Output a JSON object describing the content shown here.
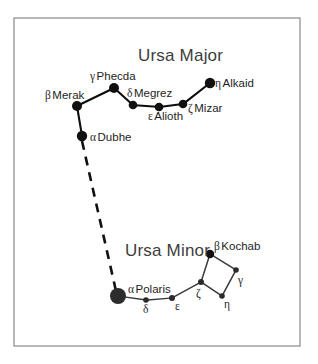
{
  "figure": {
    "title_major": "Ursa Major",
    "title_minor": "Ursa Minor",
    "frame_color": "#8a8a8a",
    "background_color": "#ffffff",
    "star_color": "#101010"
  },
  "chart_data": {
    "type": "scatter",
    "xlabel": "",
    "ylabel": "",
    "grid": false,
    "legend": "none",
    "xlim": [
      0,
      318
    ],
    "ylim": [
      0,
      364
    ],
    "annotations": [
      "Ursa Major",
      "Ursa Minor"
    ],
    "constellations": [
      {
        "name": "Ursa Major",
        "label_x": 138,
        "label_y": 61,
        "stars": [
          {
            "id": "merak",
            "greek": "β",
            "name": "Merak",
            "x": 77,
            "y": 106,
            "r": 5.0,
            "label_x": 45,
            "label_y": 99,
            "label_anchor": "start"
          },
          {
            "id": "phecda",
            "greek": "γ",
            "name": "Phecda",
            "x": 114,
            "y": 88,
            "r": 5.0,
            "label_x": 90,
            "label_y": 80,
            "label_anchor": "start"
          },
          {
            "id": "megrez",
            "greek": "δ",
            "name": "Megrez",
            "x": 133,
            "y": 105,
            "r": 4.3,
            "label_x": 127,
            "label_y": 97,
            "label_anchor": "start"
          },
          {
            "id": "alioth",
            "greek": "ε",
            "name": "Alioth",
            "x": 159,
            "y": 107,
            "r": 4.3,
            "label_x": 148,
            "label_y": 120,
            "label_anchor": "start"
          },
          {
            "id": "mizar",
            "greek": "ζ",
            "name": "Mizar",
            "x": 183,
            "y": 104,
            "r": 4.3,
            "label_x": 188,
            "label_y": 112,
            "label_anchor": "start"
          },
          {
            "id": "alkaid",
            "greek": "η",
            "name": "Alkaid",
            "x": 210,
            "y": 83,
            "r": 5.2,
            "label_x": 215,
            "label_y": 87,
            "label_anchor": "start"
          },
          {
            "id": "dubhe",
            "greek": "α",
            "name": "Dubhe",
            "x": 82,
            "y": 136,
            "r": 5.2,
            "label_x": 90,
            "label_y": 141,
            "label_anchor": "start"
          }
        ],
        "links": [
          [
            "dubhe",
            "merak"
          ],
          [
            "merak",
            "phecda"
          ],
          [
            "phecda",
            "megrez"
          ],
          [
            "megrez",
            "alioth"
          ],
          [
            "alioth",
            "mizar"
          ],
          [
            "mizar",
            "alkaid"
          ]
        ]
      },
      {
        "name": "Ursa Minor",
        "label_x": 125,
        "label_y": 256,
        "stars": [
          {
            "id": "polaris",
            "greek": "α",
            "name": "Polaris",
            "x": 118,
            "y": 296,
            "r": 8.0,
            "label_x": 128,
            "label_y": 293,
            "label_anchor": "start"
          },
          {
            "id": "delta",
            "greek": "δ",
            "name": "",
            "x": 146,
            "y": 300,
            "r": 2.8,
            "label_x": 143,
            "label_y": 313,
            "label_anchor": "start"
          },
          {
            "id": "epsilon",
            "greek": "ε",
            "name": "",
            "x": 172,
            "y": 298,
            "r": 3.0,
            "label_x": 175,
            "label_y": 310,
            "label_anchor": "start"
          },
          {
            "id": "zeta",
            "greek": "ζ",
            "name": "",
            "x": 201,
            "y": 282,
            "r": 3.0,
            "label_x": 196,
            "label_y": 297,
            "label_anchor": "start"
          },
          {
            "id": "kochab",
            "greek": "β",
            "name": "Kochab",
            "x": 210,
            "y": 254,
            "r": 4.2,
            "label_x": 214,
            "label_y": 250,
            "label_anchor": "start"
          },
          {
            "id": "gamma",
            "greek": "γ",
            "name": "",
            "x": 236,
            "y": 270,
            "r": 2.8,
            "label_x": 238,
            "label_y": 284,
            "label_anchor": "start"
          },
          {
            "id": "eta",
            "greek": "η",
            "name": "",
            "x": 222,
            "y": 296,
            "r": 2.8,
            "label_x": 224,
            "label_y": 308,
            "label_anchor": "start"
          }
        ],
        "links": [
          [
            "polaris",
            "delta"
          ],
          [
            "delta",
            "epsilon"
          ],
          [
            "epsilon",
            "zeta"
          ],
          [
            "zeta",
            "kochab"
          ],
          [
            "kochab",
            "gamma"
          ],
          [
            "gamma",
            "eta"
          ],
          [
            "eta",
            "zeta"
          ]
        ]
      }
    ],
    "pointer_line": {
      "from": "dubhe",
      "to": "polaris",
      "style": "dashed",
      "x1": 82,
      "y1": 141,
      "x2": 116,
      "y2": 291
    },
    "frame": {
      "x": 14,
      "y": 18,
      "width": 286,
      "height": 328
    }
  }
}
